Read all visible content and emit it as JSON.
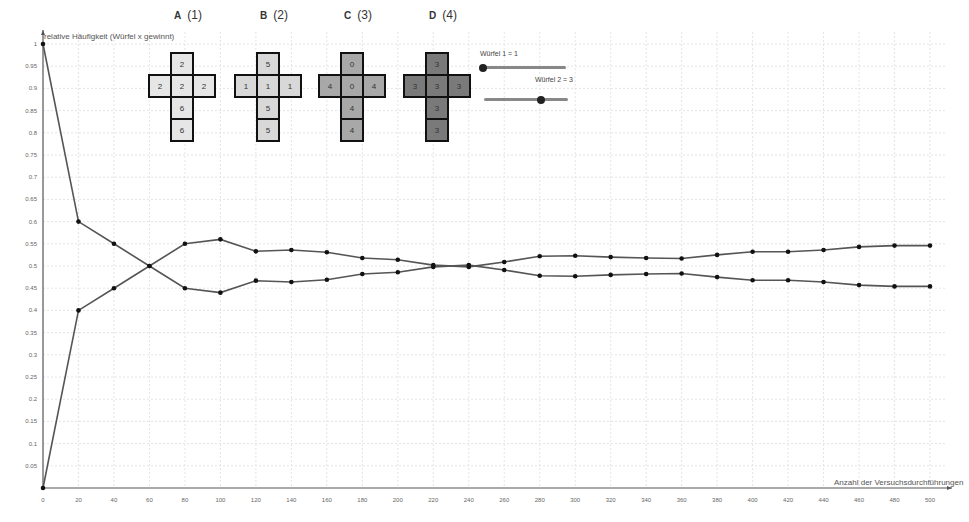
{
  "chart_data": {
    "type": "line",
    "title": "",
    "xlabel": "Anzahl der Versuchsdurchführungen",
    "ylabel": "relative Häufigkeit (Würfel x gewinnt)",
    "xlim": [
      0,
      500
    ],
    "ylim": [
      0,
      1
    ],
    "grid": true,
    "legend_position": "none",
    "x_ticks": [
      0,
      20,
      40,
      60,
      80,
      100,
      120,
      140,
      160,
      180,
      200,
      220,
      240,
      260,
      280,
      300,
      320,
      340,
      360,
      380,
      400,
      420,
      440,
      460,
      480,
      500
    ],
    "y_ticks": [
      "0.05",
      "0.1",
      "0.15",
      "0.2",
      "0.25",
      "0.3",
      "0.35",
      "0.4",
      "0.45",
      "0.5",
      "0.55",
      "0.6",
      "0.65",
      "0.7",
      "0.75",
      "0.8",
      "0.85",
      "0.9",
      "0.95",
      "1"
    ],
    "x": [
      0,
      20,
      40,
      60,
      80,
      100,
      120,
      140,
      160,
      180,
      200,
      220,
      240,
      260,
      280,
      300,
      320,
      340,
      360,
      380,
      400,
      420,
      440,
      460,
      480,
      500
    ],
    "series": [
      {
        "name": "Würfel 1 gewinnt",
        "values": [
          1,
          0.6,
          0.55,
          0.5,
          0.45,
          0.44,
          0.467,
          0.464,
          0.469,
          0.482,
          0.486,
          0.498,
          0.502,
          0.491,
          0.478,
          0.477,
          0.48,
          0.482,
          0.483,
          0.475,
          0.468,
          0.468,
          0.464,
          0.457,
          0.454,
          0.454
        ]
      },
      {
        "name": "Würfel 2 gewinnt",
        "values": [
          0,
          0.4,
          0.45,
          0.5,
          0.55,
          0.56,
          0.533,
          0.536,
          0.531,
          0.518,
          0.514,
          0.502,
          0.498,
          0.509,
          0.522,
          0.523,
          0.52,
          0.518,
          0.517,
          0.525,
          0.532,
          0.532,
          0.536,
          0.543,
          0.546,
          0.546
        ]
      }
    ]
  },
  "axes": {
    "ylabel": "relative Häufigkeit (Würfel x gewinnt)",
    "xlabel": "Anzahl der Versuchsdurchführungen",
    "origin_label": "0"
  },
  "dice": [
    {
      "letter": "A",
      "number": "(1)",
      "color": "#e6e6e6",
      "faces": [
        "2",
        "2",
        "2",
        "2",
        "6",
        "6"
      ]
    },
    {
      "letter": "B",
      "number": "(2)",
      "color": "#d8d8d8",
      "faces": [
        "5",
        "1",
        "1",
        "1",
        "5",
        "5"
      ]
    },
    {
      "letter": "C",
      "number": "(3)",
      "color": "#a8a8a8",
      "faces": [
        "0",
        "4",
        "0",
        "4",
        "4",
        "4"
      ]
    },
    {
      "letter": "D",
      "number": "(4)",
      "color": "#7a7a7a",
      "faces": [
        "3",
        "3",
        "3",
        "3",
        "3",
        "3"
      ]
    }
  ],
  "sliders": [
    {
      "label": "Würfel 1 = 1",
      "value": 1,
      "min": 1,
      "max": 4
    },
    {
      "label": "Würfel 2 = 3",
      "value": 3,
      "min": 1,
      "max": 4
    }
  ],
  "colors": {
    "line": "#555555",
    "point": "#111111",
    "grid": "#e4e4e4",
    "axis": "#555555"
  }
}
